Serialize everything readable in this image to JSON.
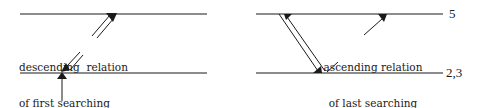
{
  "diagram": {
    "left_panel": {
      "annotation_lines": [
        "descending  relation",
        "of first searching",
        "action"
      ]
    },
    "right_panel": {
      "annotation_lines": [
        "ascending relation",
        "of last searching",
        "action"
      ],
      "level_labels": {
        "top": "5",
        "bottom": "2,3"
      }
    },
    "colors": {
      "line": "#1a1a1a",
      "background": "#ffffff"
    }
  }
}
